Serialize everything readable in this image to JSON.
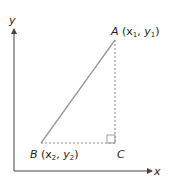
{
  "axes": {
    "x_label": "x",
    "y_label": "y"
  },
  "points": {
    "A": {
      "name": "A",
      "coords_open": " (x",
      "sub1": "1",
      "mid": ", y",
      "sub2": "1",
      "close": ")"
    },
    "B": {
      "name": "B",
      "coords_open": " (x",
      "sub1": "2",
      "mid": ", y",
      "sub2": "2",
      "close": ")"
    },
    "C": {
      "name": "C"
    }
  },
  "colors": {
    "axis": "#444444",
    "hypotenuse": "#999999",
    "dashed": "#888888"
  }
}
